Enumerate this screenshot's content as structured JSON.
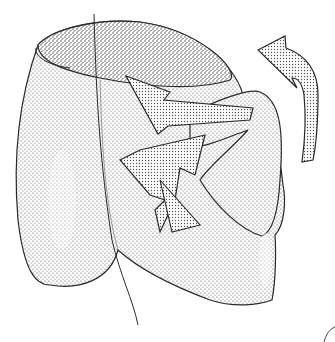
{
  "illustration": {
    "style": "stippled pen-and-ink drawing",
    "subject": "rounded organ-like form with an open top rim and curved arrows indicating rotation",
    "colors": {
      "background": "#ffffff",
      "ink": "#2a2a2a",
      "stipple_dark": "#6a6a6a",
      "stipple_light": "#a8a8a8"
    },
    "elements": [
      "main-body",
      "top-rim-opening",
      "left-lobe",
      "vertical-line",
      "central-arrow-down",
      "central-arrow-up",
      "folded-flap",
      "right-curved-arrow",
      "corner-curve-mark"
    ]
  }
}
